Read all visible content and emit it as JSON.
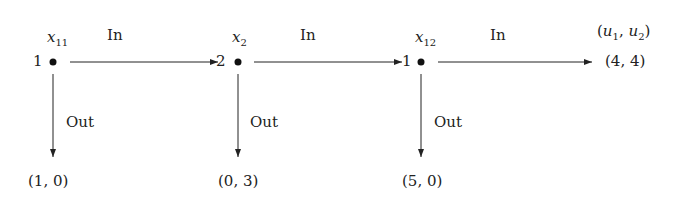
{
  "diagram": {
    "type": "extensive-form game tree (centipede)",
    "header": {
      "payoff_label": "(u₁, u₂)",
      "payoff_label_parts": {
        "u": "u",
        "s1": "1",
        "s2": "2"
      }
    },
    "nodes": [
      {
        "id": "x11",
        "name": "x",
        "sub": "11",
        "player": "1",
        "in_label": "In",
        "out_label": "Out",
        "out_payoff": "(1, 0)"
      },
      {
        "id": "x2",
        "name": "x",
        "sub": "2",
        "player": "2",
        "in_label": "In",
        "out_label": "Out",
        "out_payoff": "(0, 3)"
      },
      {
        "id": "x12",
        "name": "x",
        "sub": "12",
        "player": "1",
        "in_label": "In",
        "out_label": "Out",
        "out_payoff": "(5, 0)"
      }
    ],
    "terminal_in_payoff": "(4, 4)"
  }
}
